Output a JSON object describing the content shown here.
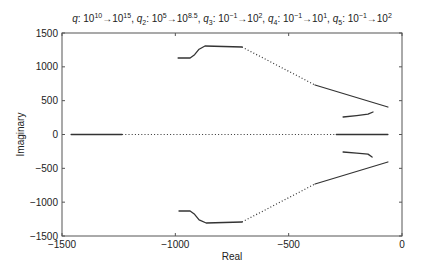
{
  "chart_data": {
    "type": "scatter",
    "title_parts": [
      {
        "sym": "q",
        "sub": "",
        "from_base": "10",
        "from_exp": "10",
        "to_base": "10",
        "to_exp": "15"
      },
      {
        "sym": "q",
        "sub": "2",
        "from_base": "10",
        "from_exp": "5",
        "to_base": "10",
        "to_exp": "8.5"
      },
      {
        "sym": "q",
        "sub": "3",
        "from_base": "10",
        "from_exp": "−1",
        "to_base": "10",
        "to_exp": "2"
      },
      {
        "sym": "q",
        "sub": "4",
        "from_base": "10",
        "from_exp": "−1",
        "to_base": "10",
        "to_exp": "1"
      },
      {
        "sym": "q",
        "sub": "5",
        "from_base": "10",
        "from_exp": "−1",
        "to_base": "10",
        "to_exp": "2"
      }
    ],
    "xlabel": "Real",
    "ylabel": "Imaginary",
    "xlim": [
      -1500,
      0
    ],
    "ylim": [
      -1500,
      1500
    ],
    "xticks": [
      -1500,
      -1000,
      -500,
      0
    ],
    "xtick_labels": [
      "−1500",
      "−1000",
      "−500",
      "0"
    ],
    "yticks": [
      1500,
      1000,
      500,
      0,
      -500,
      -1000,
      -1500
    ],
    "ytick_labels": [
      "1500",
      "1000",
      "500",
      "0",
      "−500",
      "−1000",
      "−1500"
    ],
    "grid": false,
    "legend": null,
    "line_color": "#333333",
    "series": [
      {
        "name": "upper-main-branch",
        "segments": [
          {
            "style": "solid",
            "points": [
              [
                -988,
                1130
              ],
              [
                -935,
                1130
              ],
              [
                -915,
                1180
              ],
              [
                -895,
                1260
              ],
              [
                -869,
                1308
              ],
              [
                -706,
                1293
              ]
            ]
          },
          {
            "style": "dotted",
            "points": [
              [
                -706,
                1293
              ],
              [
                -384,
                732
              ]
            ]
          },
          {
            "style": "solid",
            "points": [
              [
                -384,
                732
              ],
              [
                -62,
                406
              ]
            ]
          }
        ]
      },
      {
        "name": "lower-main-branch",
        "segments": [
          {
            "style": "solid",
            "points": [
              [
                -984,
                -1130
              ],
              [
                -935,
                -1130
              ],
              [
                -915,
                -1180
              ],
              [
                -895,
                -1260
              ],
              [
                -864,
                -1308
              ],
              [
                -706,
                -1293
              ]
            ]
          },
          {
            "style": "dotted",
            "points": [
              [
                -706,
                -1293
              ],
              [
                -384,
                -732
              ]
            ]
          },
          {
            "style": "solid",
            "points": [
              [
                -384,
                -732
              ],
              [
                -62,
                -406
              ]
            ]
          }
        ]
      },
      {
        "name": "upper-small-branch",
        "segments": [
          {
            "style": "solid",
            "points": [
              [
                -260,
                259
              ],
              [
                -200,
                280
              ],
              [
                -150,
                300
              ],
              [
                -128,
                333
              ]
            ]
          }
        ]
      },
      {
        "name": "lower-small-branch",
        "segments": [
          {
            "style": "solid",
            "points": [
              [
                -260,
                -259
              ],
              [
                -200,
                -275
              ],
              [
                -150,
                -290
              ],
              [
                -132,
                -333
              ]
            ]
          }
        ]
      },
      {
        "name": "real-axis-branch",
        "segments": [
          {
            "style": "solid",
            "points": [
              [
                -1460,
                0
              ],
              [
                -1235,
                0
              ]
            ]
          },
          {
            "style": "dotted",
            "points": [
              [
                -1235,
                0
              ],
              [
                -290,
                0
              ]
            ]
          },
          {
            "style": "solid",
            "points": [
              [
                -290,
                0
              ],
              [
                -62,
                0
              ]
            ]
          }
        ]
      }
    ]
  }
}
